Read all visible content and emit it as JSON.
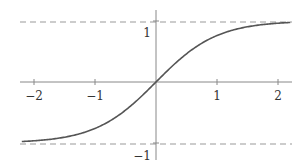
{
  "chart_data": {
    "type": "line",
    "title": "",
    "xlabel": "",
    "ylabel": "",
    "xlim": [
      -2.2,
      2.2
    ],
    "ylim": [
      -1.2,
      1.2
    ],
    "grid": false,
    "legend": null,
    "x_ticks": [
      -2,
      -1,
      1,
      2
    ],
    "x_tick_labels": [
      "−2",
      "−1",
      "1",
      "2"
    ],
    "y_ticks": [
      1,
      -1
    ],
    "y_tick_labels": [
      "1",
      "−1"
    ],
    "series": [
      {
        "name": "tanh(x)",
        "function": "tanh",
        "x": [
          -2.2,
          -2.0,
          -1.5,
          -1.0,
          -0.5,
          0,
          0.5,
          1.0,
          1.5,
          2.0,
          2.2
        ],
        "values": [
          -0.976,
          -0.964,
          -0.905,
          -0.762,
          -0.462,
          0,
          0.462,
          0.762,
          0.905,
          0.964,
          0.976
        ],
        "color": "#555555"
      }
    ],
    "asymptotes": [
      {
        "y": 1,
        "style": "dashed",
        "color": "#888888"
      },
      {
        "y": -1,
        "style": "dashed",
        "color": "#888888"
      }
    ]
  },
  "labels": {
    "xm2": "−2",
    "xm1": "−1",
    "x1": "1",
    "x2": "2",
    "y1": "1",
    "ym1": "−1"
  }
}
